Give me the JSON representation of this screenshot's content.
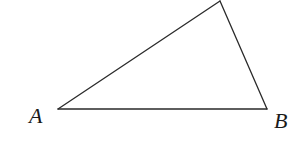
{
  "diagram": {
    "type": "triangle",
    "stroke_color": "#2a2a2a",
    "background": "#ffffff",
    "vertices": {
      "A": {
        "label": "A",
        "x": 58,
        "y": 109
      },
      "B": {
        "label": "B",
        "x": 267,
        "y": 109
      },
      "C": {
        "label": "",
        "x": 220,
        "y": 1
      }
    },
    "labels": {
      "A": {
        "text": "A",
        "x": 29,
        "y": 123
      },
      "B": {
        "text": "B",
        "x": 274,
        "y": 128
      }
    }
  }
}
